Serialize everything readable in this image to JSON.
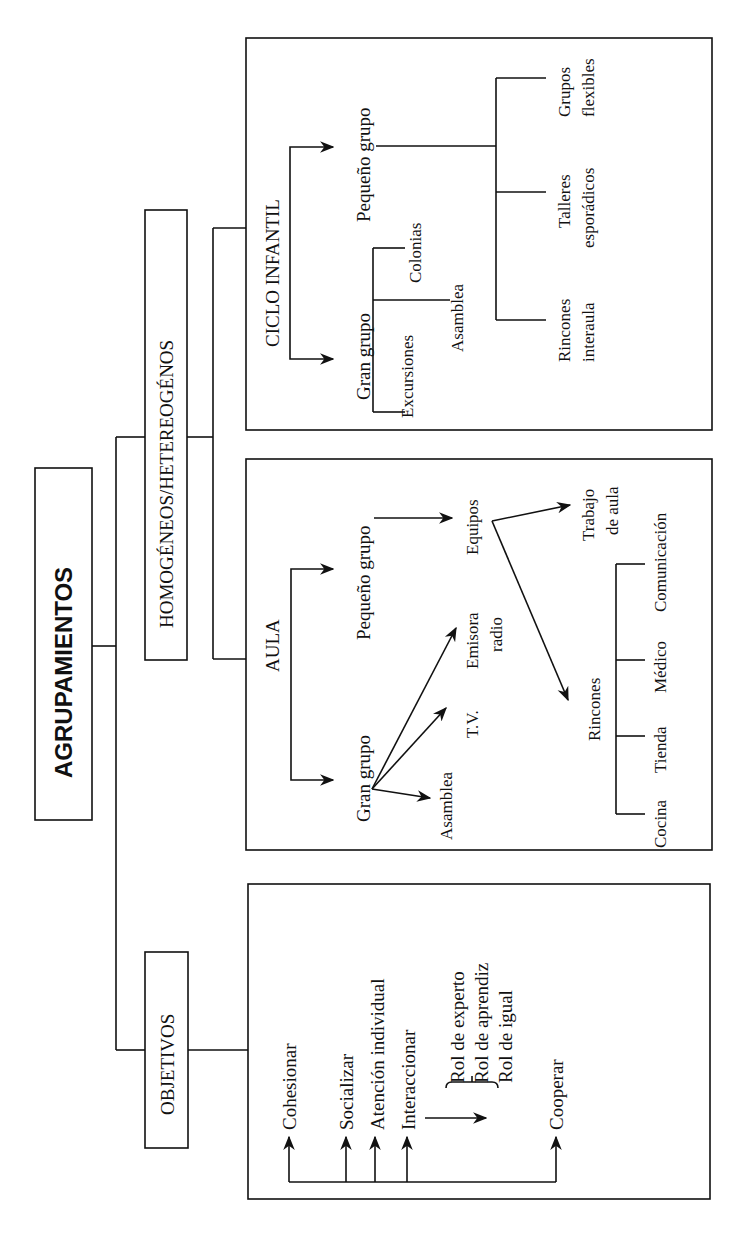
{
  "root": {
    "label": "AGRUPAMIENTOS"
  },
  "branches": {
    "homogeneos": {
      "label": "HOMOGÉNEOS/HETEREOGÉNOS"
    },
    "objetivos": {
      "label": "OBJETIVOS"
    }
  },
  "ciclo_infantil": {
    "title": "CICLO INFANTIL",
    "gran_grupo": {
      "label": "Gran grupo",
      "items": [
        "Excursiones",
        "Asamblea",
        "Colonias"
      ]
    },
    "pequeno_grupo": {
      "label": "Pequeño grupo",
      "items": [
        {
          "line1": "Rincones",
          "line2": "interaula"
        },
        {
          "line1": "Talleres",
          "line2": "esporádicos"
        },
        {
          "line1": "Grupos",
          "line2": "flexibles"
        }
      ]
    }
  },
  "aula": {
    "title": "AULA",
    "gran_grupo": {
      "label": "Gran grupo",
      "targets": [
        "Asamblea",
        "T.V.",
        "Emisora",
        "radio"
      ]
    },
    "pequeno_grupo": {
      "label": "Pequeño grupo"
    },
    "equipos": {
      "label": "Equipos",
      "targets": {
        "trabajo_line1": "Trabajo",
        "trabajo_line2": "de aula",
        "rincones": "Rincones"
      }
    },
    "rincones": {
      "items": [
        "Cocina",
        "Tienda",
        "Médico",
        "Comunicación"
      ]
    }
  },
  "objetivos": {
    "items": [
      "Cohesionar",
      "Socializar",
      "Atención individual",
      "Interaccionar",
      "Cooperar"
    ],
    "roles": [
      "Rol de experto",
      "Rol de aprendiz",
      "Rol de igual"
    ]
  }
}
